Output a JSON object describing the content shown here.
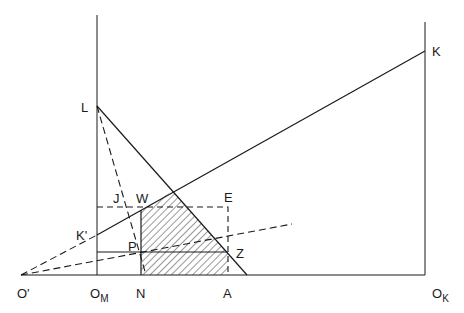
{
  "diagram": {
    "labels": {
      "L": "L",
      "K": "K",
      "K_prime": "K'",
      "J": "J",
      "W": "W",
      "E": "E",
      "P": "P",
      "Z": "Z",
      "O_prime": "O'",
      "O_M_main": "O",
      "O_M_sub": "M",
      "N": "N",
      "A": "A",
      "O_K_main": "O",
      "O_K_sub": "K"
    },
    "colors": {
      "ink": "#1a1a1a",
      "background": "#ffffff"
    }
  }
}
